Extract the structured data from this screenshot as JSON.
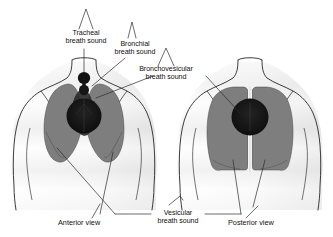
{
  "figure": {
    "type": "anatomical-diagram",
    "views": [
      {
        "id": "anterior",
        "label": "Anterior view"
      },
      {
        "id": "posterior",
        "label": "Posterior view"
      }
    ]
  },
  "labels": {
    "tracheal": {
      "line1": "Tracheal",
      "line2": "breath sound"
    },
    "bronchial": {
      "line1": "Bronchial",
      "line2": "breath sound"
    },
    "bronchovesicular": {
      "line1": "Bronchovesicular",
      "line2": "breath sound"
    },
    "vesicular": {
      "line1": "Vesicular",
      "line2": "breath sound"
    }
  },
  "view_labels": {
    "anterior": "Anterior view",
    "posterior": "Posterior view"
  },
  "colors": {
    "background": "#ffffff",
    "outline": "#1a1a1a",
    "skin_shade": "#e9e9e9",
    "lung_field": "#7e7e7e",
    "lung_field_dark": "#6d6d6d",
    "dark_zone": "#151515",
    "leader_line": "#2b2b2b",
    "text": "#111111"
  }
}
